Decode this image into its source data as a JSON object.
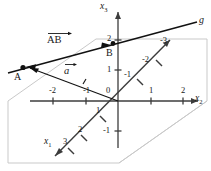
{
  "figure": {
    "type": "3d-coordinate-diagram"
  },
  "axes": {
    "x1": {
      "label": "x",
      "sub": "1",
      "direction": "down-left"
    },
    "x2": {
      "label": "x",
      "sub": "2",
      "direction": "right"
    },
    "x3": {
      "label": "x",
      "sub": "3",
      "direction": "up"
    }
  },
  "ticks": {
    "x1_positive": [
      "1",
      "2",
      "3"
    ],
    "x1_negative": [
      "-1",
      "-2",
      "-3"
    ],
    "x2_positive": [
      "1",
      "2"
    ],
    "x2_negative": [
      "-2",
      "-1"
    ],
    "x3_positive": [
      "1",
      "2"
    ],
    "x3_negative": [
      "-1"
    ],
    "origin": "0"
  },
  "points": {
    "A": "A",
    "B": "B"
  },
  "vectors": {
    "ab": "AB",
    "a": "a"
  },
  "line": {
    "g": "g"
  },
  "colors": {
    "stroke": "#1a1a1a",
    "axis": "#3c3c3c",
    "plane": "#c9c9c9",
    "background": "#ffffff"
  }
}
